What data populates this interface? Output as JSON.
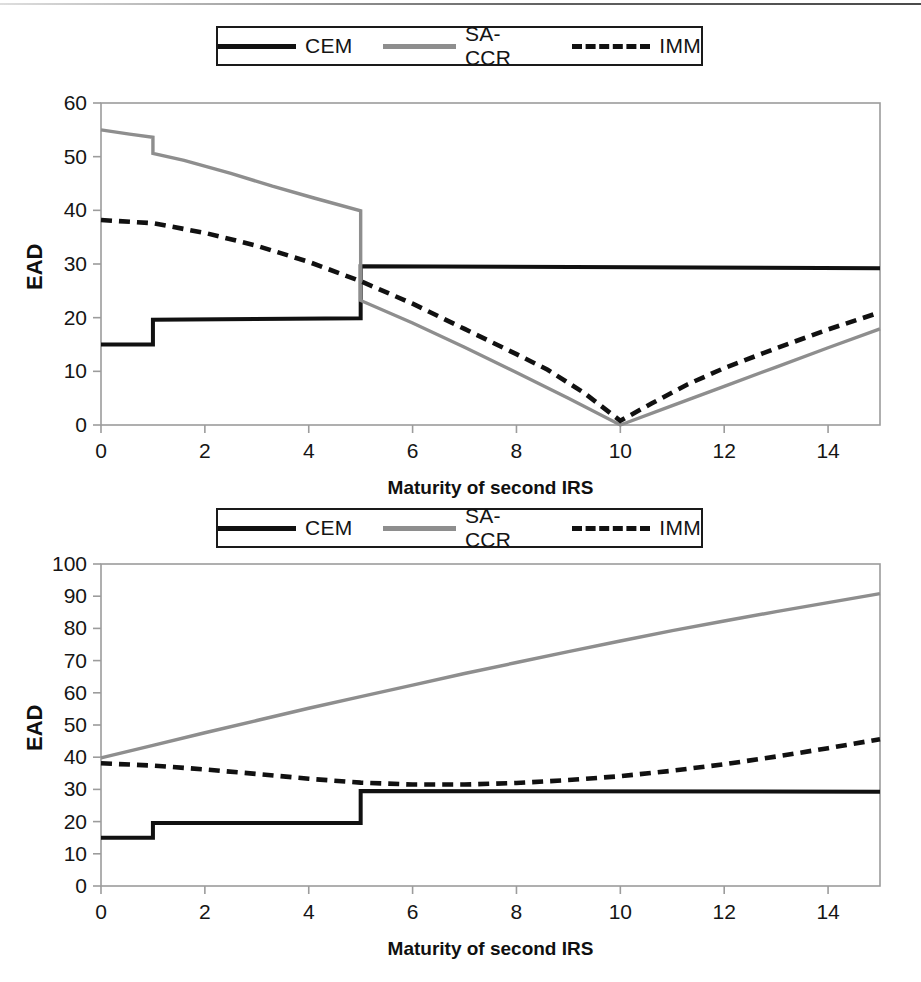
{
  "document": {
    "kind": "two stacked line charts",
    "top_rule_visible": true
  },
  "legend": {
    "entries": [
      {
        "label": "CEM",
        "style": "solid",
        "color": "#111111"
      },
      {
        "label": "SA-CCR",
        "style": "solid",
        "color": "#8e8e8e"
      },
      {
        "label": "IMM",
        "style": "dashed",
        "color": "#111111"
      }
    ]
  },
  "axis_titles": {
    "x": "Maturity of second IRS",
    "y": "EAD"
  },
  "chart_data": [
    {
      "id": "top-chart",
      "type": "line",
      "title": "",
      "xlabel": "Maturity of second IRS",
      "ylabel": "EAD",
      "xlim": [
        0,
        15
      ],
      "ylim": [
        0,
        60
      ],
      "xticks": [
        0,
        2,
        4,
        6,
        8,
        10,
        12,
        14
      ],
      "xtick_labels": [
        "0",
        "2",
        "4",
        "6",
        "8",
        "10",
        "12",
        "14"
      ],
      "yticks": [
        0,
        10,
        20,
        30,
        40,
        50,
        60
      ],
      "ytick_labels": [
        "0",
        "10",
        "20",
        "30",
        "40",
        "50",
        "60"
      ],
      "grid": false,
      "legend_position": "above-plot",
      "series": [
        {
          "name": "CEM",
          "style": "solid",
          "color": "#111111",
          "points": [
            [
              0,
              15.0
            ],
            [
              1,
              15.0
            ],
            [
              1,
              19.6
            ],
            [
              5,
              19.9
            ],
            [
              5,
              29.6
            ],
            [
              15,
              29.2
            ]
          ]
        },
        {
          "name": "SA-CCR",
          "style": "solid",
          "color": "#8e8e8e",
          "points": [
            [
              0,
              55.0
            ],
            [
              0.55,
              54.2
            ],
            [
              1,
              53.6
            ],
            [
              1,
              50.6
            ],
            [
              1.6,
              49.3
            ],
            [
              2.5,
              46.9
            ],
            [
              3.3,
              44.5
            ],
            [
              4.1,
              42.3
            ],
            [
              5,
              39.9
            ],
            [
              5,
              23.2
            ],
            [
              6,
              19.0
            ],
            [
              7,
              14.5
            ],
            [
              8,
              9.8
            ],
            [
              9,
              5.0
            ],
            [
              10,
              0.0
            ],
            [
              11,
              3.6
            ],
            [
              12,
              7.2
            ],
            [
              13,
              10.8
            ],
            [
              14,
              14.4
            ],
            [
              15,
              17.9
            ]
          ]
        },
        {
          "name": "IMM",
          "style": "dashed",
          "color": "#111111",
          "points": [
            [
              0,
              38.2
            ],
            [
              1,
              37.6
            ],
            [
              2,
              35.8
            ],
            [
              3,
              33.4
            ],
            [
              4,
              30.4
            ],
            [
              5,
              26.8
            ],
            [
              6,
              22.6
            ],
            [
              7,
              17.9
            ],
            [
              8,
              13.2
            ],
            [
              8.6,
              10.3
            ],
            [
              9.3,
              6.0
            ],
            [
              10,
              0.8
            ],
            [
              10.6,
              4.0
            ],
            [
              11.3,
              7.6
            ],
            [
              12,
              10.6
            ],
            [
              13,
              14.3
            ],
            [
              14,
              17.8
            ],
            [
              15,
              21.0
            ]
          ]
        }
      ]
    },
    {
      "id": "bottom-chart",
      "type": "line",
      "title": "",
      "xlabel": "Maturity of second IRS",
      "ylabel": "EAD",
      "xlim": [
        0,
        15
      ],
      "ylim": [
        0,
        100
      ],
      "xticks": [
        0,
        2,
        4,
        6,
        8,
        10,
        12,
        14
      ],
      "xtick_labels": [
        "0",
        "2",
        "4",
        "6",
        "8",
        "10",
        "12",
        "14"
      ],
      "yticks": [
        0,
        10,
        20,
        30,
        40,
        50,
        60,
        70,
        80,
        90,
        100
      ],
      "ytick_labels": [
        "0",
        "10",
        "20",
        "30",
        "40",
        "50",
        "60",
        "70",
        "80",
        "90",
        "100"
      ],
      "grid": false,
      "legend_position": "above-plot",
      "series": [
        {
          "name": "CEM",
          "style": "solid",
          "color": "#111111",
          "points": [
            [
              0,
              15.0
            ],
            [
              1,
              15.0
            ],
            [
              1,
              19.6
            ],
            [
              5,
              19.6
            ],
            [
              5,
              29.5
            ],
            [
              15,
              29.3
            ]
          ]
        },
        {
          "name": "SA-CCR",
          "style": "solid",
          "color": "#8e8e8e",
          "points": [
            [
              0,
              39.8
            ],
            [
              1,
              43.7
            ],
            [
              2,
              47.6
            ],
            [
              3,
              51.4
            ],
            [
              4,
              55.2
            ],
            [
              5,
              58.8
            ],
            [
              6,
              62.4
            ],
            [
              7,
              66.0
            ],
            [
              8,
              69.4
            ],
            [
              9,
              72.8
            ],
            [
              10,
              76.1
            ],
            [
              11,
              79.3
            ],
            [
              12,
              82.3
            ],
            [
              13,
              85.2
            ],
            [
              14,
              88.0
            ],
            [
              15,
              90.8
            ]
          ]
        },
        {
          "name": "IMM",
          "style": "dashed",
          "color": "#111111",
          "points": [
            [
              0,
              38.1
            ],
            [
              1,
              37.4
            ],
            [
              2,
              36.2
            ],
            [
              3,
              34.8
            ],
            [
              4,
              33.3
            ],
            [
              5,
              32.1
            ],
            [
              6,
              31.5
            ],
            [
              7,
              31.5
            ],
            [
              8,
              32.0
            ],
            [
              9,
              32.9
            ],
            [
              10,
              34.1
            ],
            [
              11,
              35.8
            ],
            [
              12,
              37.8
            ],
            [
              13,
              40.2
            ],
            [
              14,
              42.8
            ],
            [
              15,
              45.6
            ]
          ]
        }
      ]
    }
  ]
}
